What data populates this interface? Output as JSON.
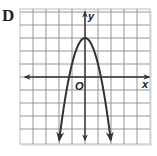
{
  "figure": {
    "option_label": "D"
  },
  "chart_data": {
    "type": "line",
    "title": "",
    "option_label": "D",
    "xlabel": "x",
    "ylabel": "y",
    "origin_label": "O",
    "grid": true,
    "xlim": [
      -5,
      5
    ],
    "ylim": [
      -5,
      5
    ],
    "grid_step": 1,
    "function": "y = -2x^2 + 3",
    "vertex": [
      0,
      3
    ],
    "x_intercepts": [
      -1.22,
      1.22
    ],
    "opens": "down",
    "series": [
      {
        "name": "parabola",
        "x": [
          -1.98,
          -1.5,
          -1.22,
          -1.0,
          -0.5,
          0,
          0.5,
          1.0,
          1.22,
          1.5,
          1.98
        ],
        "y": [
          -4.85,
          -1.5,
          0,
          1,
          2.5,
          3,
          2.5,
          1,
          0,
          -1.5,
          -4.85
        ]
      }
    ],
    "colors": {
      "grid": "#8a8a8a",
      "curve": "#333333",
      "axes": "#333333",
      "border": "#c8c8c8"
    }
  }
}
